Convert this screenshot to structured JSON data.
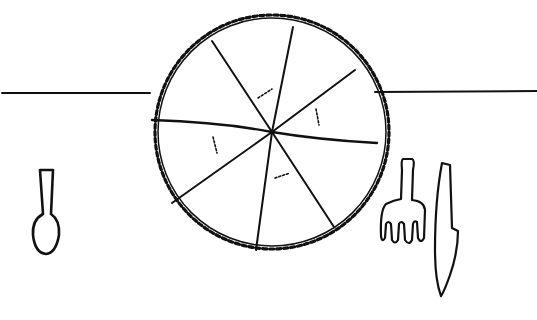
{
  "scene": {
    "description": "Line drawing of a pie cut into 8 slices on a table, with a spoon on the left and a fork and knife on the right",
    "stroke_color": "#111111",
    "background": "#ffffff"
  },
  "pie": {
    "slices": 8
  },
  "utensils": [
    {
      "name": "spoon",
      "position": "left"
    },
    {
      "name": "fork",
      "position": "right"
    },
    {
      "name": "knife",
      "position": "right"
    }
  ]
}
